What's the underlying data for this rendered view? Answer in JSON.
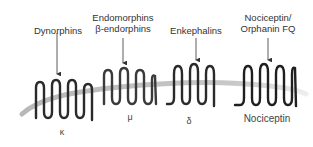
{
  "diagram": {
    "membrane_color": "#c8c8c8",
    "receptor_color": "#333333",
    "receptors": [
      {
        "ligand_line1": "Dynorphins",
        "ligand_line2": "",
        "receptor_label": "κ"
      },
      {
        "ligand_line1": "Endomorphins",
        "ligand_line2": "β-endorphins",
        "receptor_label": "μ"
      },
      {
        "ligand_line1": "Enkephalins",
        "ligand_line2": "",
        "receptor_label": "δ"
      },
      {
        "ligand_line1": "Nociceptin/",
        "ligand_line2": "Orphanin FQ",
        "receptor_label": "Nociceptin"
      }
    ]
  }
}
